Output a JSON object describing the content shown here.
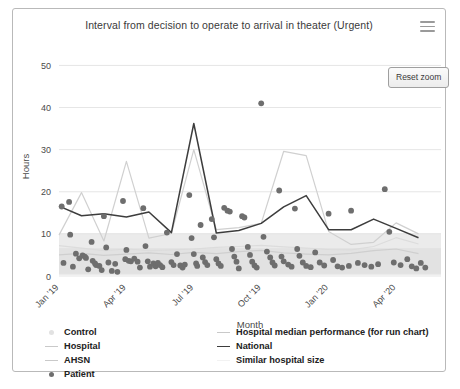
{
  "chart_panel": {
    "title": "Interval from decision to operate to arrival in theater (Urgent)",
    "menu_icon": "hamburger-menu-icon",
    "reset_zoom_label": "Reset zoom"
  },
  "legend": {
    "left": [
      {
        "label": "Control",
        "marker": "circle",
        "color": "#e2e2e2"
      },
      {
        "label": "Hospital",
        "marker": "line",
        "color": "#cfcfcf"
      },
      {
        "label": "AHSN",
        "marker": "line",
        "color": "#dcdcdc"
      },
      {
        "label": "Patient",
        "marker": "dot",
        "color": "#6e6e6e"
      }
    ],
    "right": [
      {
        "label": "Hospital median performance (for run chart)",
        "marker": "line",
        "color": "#d0d0d0"
      },
      {
        "label": "National",
        "marker": "line",
        "color": "#3d3d3d"
      },
      {
        "label": "Similar hospital size",
        "marker": "line",
        "color": "#f4f4f4"
      }
    ]
  },
  "chart_data": {
    "type": "scatter",
    "title": "Interval from decision to operate to arrival in theater (Urgent)",
    "xlabel": "Month",
    "ylabel": "Hours",
    "ylim": [
      0,
      52
    ],
    "yticks": [
      0,
      10,
      20,
      30,
      40,
      50
    ],
    "ytick_labels": [
      "0",
      "10",
      "20",
      "30",
      "40",
      "50"
    ],
    "xlim": [
      0,
      17
    ],
    "xticks": [
      0,
      3,
      6,
      9,
      12,
      15
    ],
    "xtick_labels": [
      "Jan '19",
      "Apr '19",
      "Jul '19",
      "Oct '19",
      "Jan '20",
      "Apr '20"
    ],
    "grid": "horizontal",
    "legend_position": "bottom",
    "shaded_band": {
      "label": "Similar hospital size range",
      "y0": 0.2,
      "y1": 10.2,
      "color": "#ebebeb"
    },
    "shaded_band_inner": {
      "y0": 0.5,
      "y1": 6.6,
      "color": "#e2e2e2"
    },
    "series": [
      {
        "name": "National",
        "type": "line",
        "color": "#3d3d3d",
        "x": [
          0,
          1,
          2,
          3,
          4,
          5,
          6,
          7,
          8,
          9,
          10,
          11,
          12,
          13,
          14,
          15,
          16
        ],
        "values": [
          16.6,
          14.3,
          14.8,
          14.0,
          15.2,
          10.3,
          36.2,
          10.2,
          10.8,
          12.5,
          16.4,
          19.1,
          11.0,
          11.0,
          13.5,
          11.3,
          9.1
        ]
      },
      {
        "name": "Hospital median performance (for run chart)",
        "type": "line",
        "color": "#d0d0d0",
        "x": [
          0,
          1,
          2,
          3,
          4,
          5,
          6,
          7,
          8,
          9,
          10,
          11,
          12,
          13,
          14,
          15,
          16
        ],
        "values": [
          9.7,
          19.8,
          8.3,
          27.2,
          9.0,
          10.1,
          30.0,
          11.0,
          11.5,
          12.5,
          29.6,
          28.6,
          10.6,
          7.5,
          8.0,
          12.6,
          10.0
        ]
      },
      {
        "name": "AHSN",
        "type": "line",
        "color": "#dcdcdc",
        "x": [
          0,
          1,
          2,
          3,
          4,
          5,
          6,
          7,
          8,
          9,
          10,
          11,
          12,
          13,
          14,
          15,
          16
        ],
        "values": [
          7.2,
          6.6,
          6.0,
          6.4,
          6.0,
          6.2,
          6.4,
          6.8,
          7.0,
          7.3,
          6.9,
          6.6,
          6.3,
          6.2,
          7.0,
          9.1,
          7.6
        ]
      },
      {
        "name": "Hospital",
        "type": "line",
        "color": "#cfcfcf",
        "x": [
          0,
          1,
          2,
          3,
          4,
          5,
          6,
          7,
          8,
          9,
          10,
          11,
          12,
          13,
          14,
          15,
          16
        ],
        "values": [
          5.0,
          5.4,
          4.9,
          5.2,
          5.5,
          5.1,
          5.6,
          5.3,
          5.8,
          6.1,
          5.5,
          5.2,
          5.0,
          5.4,
          6.0,
          6.4,
          5.3
        ]
      },
      {
        "name": "Patient",
        "type": "scatter",
        "color": "#6e6e6e",
        "points": [
          [
            0.12,
            16.5
          ],
          [
            0.2,
            3.1
          ],
          [
            0.45,
            17.6
          ],
          [
            0.5,
            9.8
          ],
          [
            0.62,
            2.2
          ],
          [
            0.75,
            5.3
          ],
          [
            0.9,
            4.2
          ],
          [
            1.05,
            4.9
          ],
          [
            1.15,
            4.6
          ],
          [
            1.2,
            4.3
          ],
          [
            1.3,
            1.6
          ],
          [
            1.45,
            8.1
          ],
          [
            1.5,
            3.6
          ],
          [
            1.6,
            3.0
          ],
          [
            1.65,
            2.6
          ],
          [
            1.8,
            2.4
          ],
          [
            1.9,
            1.4
          ],
          [
            2.0,
            14.2
          ],
          [
            2.1,
            6.8
          ],
          [
            2.2,
            3.2
          ],
          [
            2.35,
            1.2
          ],
          [
            2.5,
            2.9
          ],
          [
            2.6,
            1.0
          ],
          [
            2.85,
            17.8
          ],
          [
            2.95,
            4.0
          ],
          [
            3.0,
            6.2
          ],
          [
            3.1,
            3.6
          ],
          [
            3.2,
            3.5
          ],
          [
            3.35,
            4.1
          ],
          [
            3.5,
            3.4
          ],
          [
            3.6,
            2.0
          ],
          [
            3.75,
            16.1
          ],
          [
            3.85,
            7.1
          ],
          [
            3.95,
            3.5
          ],
          [
            4.05,
            2.2
          ],
          [
            4.2,
            3.0
          ],
          [
            4.3,
            2.3
          ],
          [
            4.4,
            3.1
          ],
          [
            4.5,
            2.6
          ],
          [
            4.6,
            2.1
          ],
          [
            4.8,
            10.3
          ],
          [
            5.0,
            3.3
          ],
          [
            5.1,
            2.6
          ],
          [
            5.25,
            5.2
          ],
          [
            5.4,
            2.5
          ],
          [
            5.5,
            2.0
          ],
          [
            5.6,
            2.7
          ],
          [
            5.8,
            19.2
          ],
          [
            5.9,
            9.0
          ],
          [
            6.0,
            5.2
          ],
          [
            6.1,
            3.0
          ],
          [
            6.15,
            2.4
          ],
          [
            6.3,
            12.1
          ],
          [
            6.4,
            4.4
          ],
          [
            6.5,
            3.3
          ],
          [
            6.6,
            2.6
          ],
          [
            6.8,
            13.5
          ],
          [
            6.9,
            9.2
          ],
          [
            7.0,
            4.0
          ],
          [
            7.1,
            3.0
          ],
          [
            7.2,
            2.4
          ],
          [
            7.35,
            16.2
          ],
          [
            7.5,
            15.5
          ],
          [
            7.6,
            15.3
          ],
          [
            7.7,
            6.4
          ],
          [
            7.8,
            4.6
          ],
          [
            7.9,
            3.4
          ],
          [
            8.0,
            1.8
          ],
          [
            8.15,
            14.2
          ],
          [
            8.25,
            13.9
          ],
          [
            8.4,
            6.9
          ],
          [
            8.5,
            5.0
          ],
          [
            8.6,
            3.4
          ],
          [
            8.7,
            2.5
          ],
          [
            8.8,
            2.0
          ],
          [
            9.0,
            41.0
          ],
          [
            9.1,
            9.3
          ],
          [
            9.25,
            5.8
          ],
          [
            9.4,
            4.4
          ],
          [
            9.5,
            3.2
          ],
          [
            9.6,
            2.5
          ],
          [
            9.8,
            20.3
          ],
          [
            9.9,
            4.6
          ],
          [
            10.0,
            3.5
          ],
          [
            10.2,
            2.7
          ],
          [
            10.35,
            2.2
          ],
          [
            10.5,
            16.0
          ],
          [
            10.6,
            6.4
          ],
          [
            10.7,
            4.8
          ],
          [
            10.85,
            3.2
          ],
          [
            11.0,
            2.4
          ],
          [
            11.2,
            2.1
          ],
          [
            11.4,
            5.6
          ],
          [
            11.6,
            3.2
          ],
          [
            11.8,
            2.5
          ],
          [
            12.0,
            14.8
          ],
          [
            12.2,
            3.8
          ],
          [
            12.4,
            2.3
          ],
          [
            12.6,
            2.0
          ],
          [
            12.9,
            2.4
          ],
          [
            13.0,
            15.5
          ],
          [
            13.3,
            3.1
          ],
          [
            13.6,
            2.6
          ],
          [
            13.9,
            2.2
          ],
          [
            14.2,
            2.8
          ],
          [
            14.5,
            20.6
          ],
          [
            14.7,
            10.5
          ],
          [
            14.9,
            3.2
          ],
          [
            15.2,
            2.6
          ],
          [
            15.5,
            4.0
          ],
          [
            15.7,
            2.3
          ],
          [
            15.9,
            1.8
          ],
          [
            16.1,
            3.1
          ],
          [
            16.3,
            2.0
          ]
        ]
      }
    ]
  }
}
